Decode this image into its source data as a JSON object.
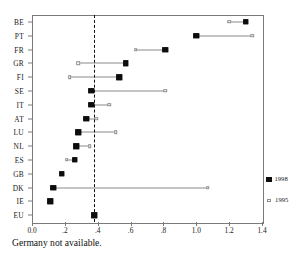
{
  "chart_data": {
    "type": "scatter",
    "title": "",
    "subtitle": "",
    "xlabel": "",
    "ylabel": "",
    "xlim": [
      0.0,
      1.4
    ],
    "grid": false,
    "legend_position": "right",
    "categories": [
      "BE",
      "PT",
      "FR",
      "GR",
      "FI",
      "SE",
      "IT",
      "AT",
      "LU",
      "NL",
      "ES",
      "GB",
      "DK",
      "IE",
      "EU"
    ],
    "xticks": [
      0.0,
      0.2,
      0.4,
      0.6,
      0.8,
      1.0,
      1.2,
      1.4
    ],
    "xticklabels": [
      "0.0",
      ".2",
      ".4",
      ".6",
      ".8",
      "1.0",
      "1.2",
      "1.4"
    ],
    "reference_line": {
      "value": 0.38,
      "style": "dashed",
      "color": "#111111"
    },
    "series": [
      {
        "name": "1998",
        "marker": "filled-square",
        "color": "#0d0d0d",
        "values": [
          1.3,
          1.0,
          0.81,
          0.57,
          0.53,
          0.36,
          0.36,
          0.33,
          0.28,
          0.27,
          0.26,
          0.18,
          0.13,
          0.11,
          0.38
        ]
      },
      {
        "name": "1995",
        "marker": "open-square",
        "color": "#8d8d8d",
        "values": [
          1.2,
          1.34,
          0.63,
          0.28,
          0.23,
          0.81,
          0.47,
          0.39,
          0.51,
          0.35,
          0.21,
          0.18,
          1.07,
          0.11,
          0.38
        ]
      }
    ],
    "annotations": [
      {
        "text": "Germany not available.",
        "position": "below-axis-left"
      }
    ]
  },
  "legend": {
    "entries": [
      {
        "label": "1998",
        "marker": "filled-square-icon"
      },
      {
        "label": "1995",
        "marker": "open-square-icon"
      }
    ]
  },
  "caption": {
    "text": "Germany not available."
  }
}
